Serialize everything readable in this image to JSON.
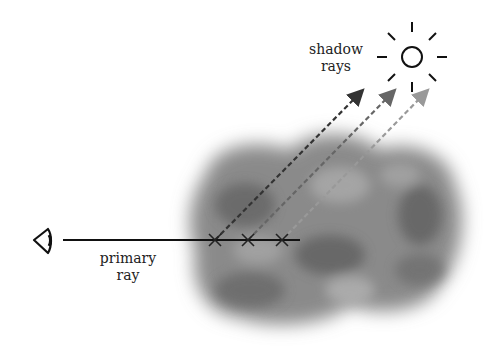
{
  "diagram": {
    "labels": {
      "shadow_rays_line1": "shadow",
      "shadow_rays_line2": "rays",
      "primary_ray_line1": "primary",
      "primary_ray_line2": "ray"
    },
    "elements": {
      "eye": {
        "icon": "eye-icon",
        "x": 43,
        "y": 240
      },
      "primary_ray": {
        "x1": 63,
        "y1": 240,
        "x2": 300,
        "y2": 240,
        "color": "#111111"
      },
      "sample_points": [
        {
          "x": 215,
          "y": 240
        },
        {
          "x": 248,
          "y": 240
        },
        {
          "x": 282,
          "y": 240
        }
      ],
      "shadow_rays": [
        {
          "x1": 215,
          "y1": 240,
          "x2": 363,
          "y2": 90,
          "color": "#333333"
        },
        {
          "x1": 248,
          "y1": 240,
          "x2": 395,
          "y2": 90,
          "color": "#666666"
        },
        {
          "x1": 282,
          "y1": 240,
          "x2": 428,
          "y2": 90,
          "color": "#999999"
        }
      ],
      "light_source": {
        "icon": "sun-icon",
        "x": 412,
        "y": 57,
        "radius": 10
      },
      "medium": {
        "icon": "cloud-volume",
        "color": "#7a7a7a"
      }
    }
  }
}
